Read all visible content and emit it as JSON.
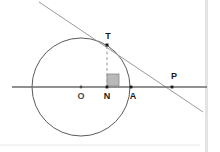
{
  "figure": {
    "canvas": {
      "width": 220,
      "height": 152,
      "background": "#ffffff"
    },
    "colors": {
      "circle_stroke": "#5a5a5a",
      "axis_line": "#6b6b6b",
      "tangent_line": "#9a9a9a",
      "dashed_line": "#b0b0b0",
      "right_angle_fill": "#b9b9b9",
      "right_angle_stroke": "#8a8a8a",
      "point_fill": "#1a1a1a",
      "label_text": "#1a1a1a",
      "label_text_light": "#4a4a4a",
      "edge_band": "#e3e3e3",
      "baseline_rule": "#e8e8e8"
    },
    "points": [
      {
        "name": "O",
        "label": "O",
        "x": 81,
        "y": 87,
        "label_x": 81,
        "label_y": 99,
        "role": "circle-center",
        "label_style": "light",
        "marker": "small"
      },
      {
        "name": "N",
        "label": "N",
        "x": 107,
        "y": 87,
        "label_x": 107,
        "label_y": 99,
        "role": "foot-of-perpendicular",
        "label_style": "dark",
        "marker": "normal"
      },
      {
        "name": "A",
        "label": "A",
        "x": 131,
        "y": 87,
        "label_x": 133,
        "label_y": 99,
        "role": "circle-axis-intersection",
        "label_style": "dark",
        "marker": "normal"
      },
      {
        "name": "T",
        "label": "T",
        "x": 107,
        "y": 45,
        "label_x": 108,
        "label_y": 39,
        "role": "tangency-point",
        "label_style": "dark",
        "marker": "normal"
      },
      {
        "name": "P",
        "label": "P",
        "x": 172,
        "y": 87,
        "label_x": 174,
        "label_y": 79,
        "role": "external-point",
        "label_style": "dark",
        "marker": "normal"
      }
    ],
    "circle": {
      "cx": 81,
      "cy": 87,
      "r": 49
    },
    "axis_line": {
      "x1": 12,
      "y1": 87,
      "x2": 207,
      "y2": 87
    },
    "tangent_line": {
      "x1": 39,
      "y1": 2,
      "x2": 203,
      "y2": 112
    },
    "dashed_segment": {
      "x1": 107,
      "y1": 46,
      "x2": 107,
      "y2": 86
    },
    "right_angle_marker": {
      "x": 107,
      "y": 74,
      "size": 12
    },
    "edge_band": {
      "x": 205,
      "y": 0,
      "width": 3,
      "height": 152
    },
    "baseline_rule": {
      "x1": 0,
      "y1": 145,
      "x2": 200,
      "y2": 145
    }
  }
}
